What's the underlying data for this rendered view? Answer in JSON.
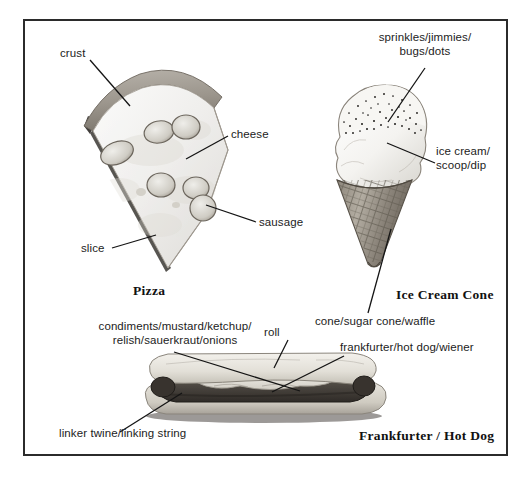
{
  "page": {
    "kind": "picture-dictionary-plate",
    "background_color": "#ffffff",
    "frame_color": "#2b2b2b",
    "text_color": "#1c1c1c"
  },
  "entries": [
    {
      "id": "pizza",
      "headword": "Pizza",
      "illustration": "pizza-slice",
      "callouts": [
        {
          "id": "crust",
          "text": "crust"
        },
        {
          "id": "cheese",
          "text": "cheese"
        },
        {
          "id": "sausage",
          "text": "sausage"
        },
        {
          "id": "slice",
          "text": "slice"
        }
      ]
    },
    {
      "id": "ice-cream-cone",
      "headword": "Ice Cream Cone",
      "illustration": "ice-cream-cone",
      "callouts": [
        {
          "id": "sprinkles",
          "text": "sprinkles/jimmies/\nbugs/dots"
        },
        {
          "id": "ice-cream",
          "text": "ice cream/\nscoop/dip"
        },
        {
          "id": "cone",
          "text": "cone/sugar cone/waffle"
        }
      ]
    },
    {
      "id": "frankfurter",
      "headword": "Frankfurter / Hot Dog",
      "illustration": "hot-dog",
      "callouts": [
        {
          "id": "condiments",
          "text": "condiments/mustard/ketchup/\nrelish/sauerkraut/onions"
        },
        {
          "id": "roll",
          "text": "roll"
        },
        {
          "id": "frankfurter",
          "text": "frankfurter/hot dog/wiener"
        },
        {
          "id": "linker",
          "text": "linker twine/linking string"
        }
      ]
    }
  ]
}
